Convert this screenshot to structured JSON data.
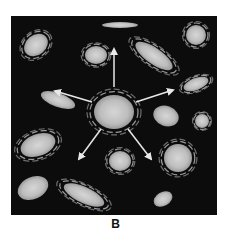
{
  "figure": {
    "label": "B",
    "background_color": "#0c0c0c",
    "galaxy_color": "#c8c8c8",
    "arrow_color": "#e8e8e8"
  },
  "galaxies": [
    {
      "id": "center",
      "type": "spiral",
      "cx": 103,
      "cy": 96,
      "rx": 20,
      "ry": 17,
      "rot": 0
    },
    {
      "id": "top-left",
      "type": "spiral",
      "cx": 25,
      "cy": 29,
      "rx": 13,
      "ry": 10,
      "rot": -40
    },
    {
      "id": "top-mid-left",
      "type": "spiral",
      "cx": 85,
      "cy": 39,
      "rx": 11,
      "ry": 9,
      "rot": 0
    },
    {
      "id": "top",
      "type": "elliptical",
      "cx": 109,
      "cy": 9,
      "rx": 18,
      "ry": 3,
      "rot": 0
    },
    {
      "id": "top-right-big",
      "type": "spiral",
      "cx": 143,
      "cy": 40,
      "rx": 22,
      "ry": 8,
      "rot": 35
    },
    {
      "id": "top-right-corner",
      "type": "spiral",
      "cx": 185,
      "cy": 19,
      "rx": 10,
      "ry": 10,
      "rot": 0
    },
    {
      "id": "right-upper",
      "type": "spiral",
      "cx": 185,
      "cy": 68,
      "rx": 13,
      "ry": 6,
      "rot": -20
    },
    {
      "id": "left-mid",
      "type": "elliptical",
      "cx": 47,
      "cy": 84,
      "rx": 18,
      "ry": 7,
      "rot": 20
    },
    {
      "id": "right-mid",
      "type": "elliptical",
      "cx": 155,
      "cy": 100,
      "rx": 13,
      "ry": 10,
      "rot": 20
    },
    {
      "id": "right-small",
      "type": "spiral",
      "cx": 191,
      "cy": 105,
      "rx": 7,
      "ry": 7,
      "rot": 0
    },
    {
      "id": "left-lower",
      "type": "spiral",
      "cx": 27,
      "cy": 129,
      "rx": 18,
      "ry": 11,
      "rot": -20
    },
    {
      "id": "center-lower",
      "type": "spiral",
      "cx": 109,
      "cy": 145,
      "rx": 11,
      "ry": 10,
      "rot": 0
    },
    {
      "id": "right-lower",
      "type": "spiral",
      "cx": 167,
      "cy": 142,
      "rx": 14,
      "ry": 14,
      "rot": 0
    },
    {
      "id": "bottom-left",
      "type": "elliptical",
      "cx": 22,
      "cy": 172,
      "rx": 16,
      "ry": 11,
      "rot": -25
    },
    {
      "id": "bottom-mid",
      "type": "spiral",
      "cx": 73,
      "cy": 179,
      "rx": 22,
      "ry": 8,
      "rot": 25
    },
    {
      "id": "bottom-right",
      "type": "elliptical",
      "cx": 152,
      "cy": 183,
      "rx": 10,
      "ry": 7,
      "rot": -30
    }
  ],
  "arrows": [
    {
      "id": "up",
      "x1": 103,
      "y1": 71,
      "x2": 103,
      "y2": 33
    },
    {
      "id": "left",
      "x1": 81,
      "y1": 86,
      "x2": 44,
      "y2": 75
    },
    {
      "id": "right",
      "x1": 125,
      "y1": 86,
      "x2": 162,
      "y2": 74
    },
    {
      "id": "down-left",
      "x1": 90,
      "y1": 113,
      "x2": 68,
      "y2": 143
    },
    {
      "id": "down-right",
      "x1": 117,
      "y1": 113,
      "x2": 140,
      "y2": 143
    }
  ]
}
